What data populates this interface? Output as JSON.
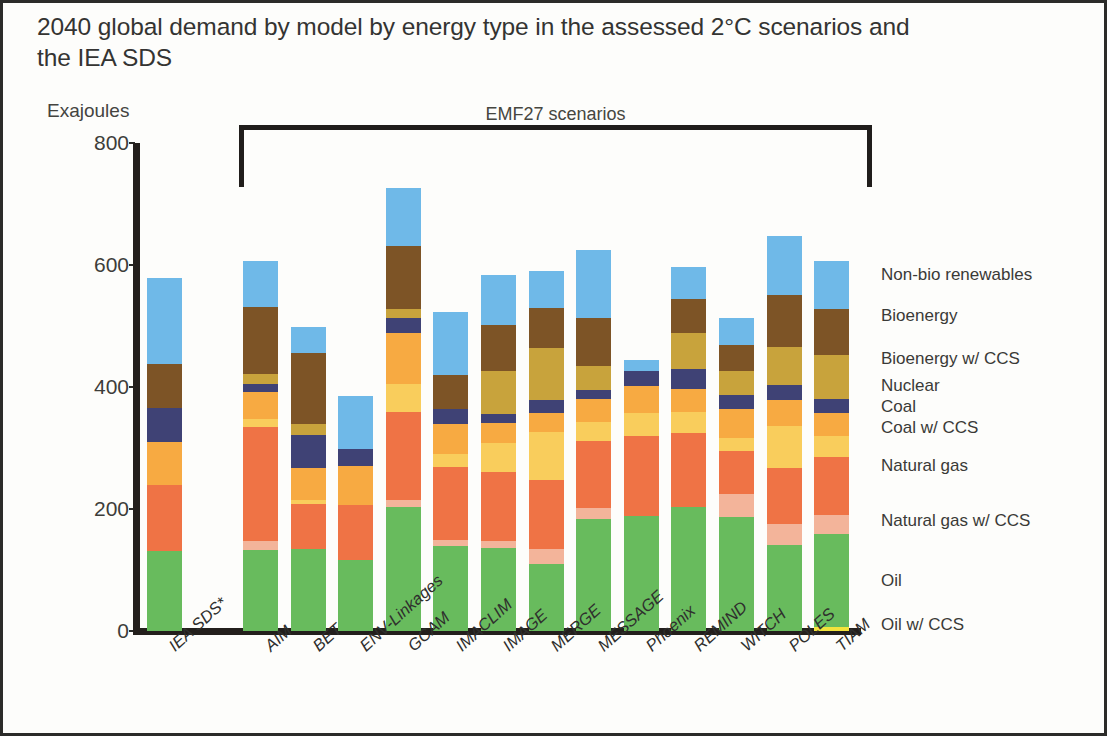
{
  "title": "2040 global demand by model by energy type in the assessed 2°C scenarios and the IEA SDS",
  "axis_unit": "Exajoules",
  "bracket_label": "EMF27 scenarios",
  "chart_data": {
    "type": "bar",
    "subtype": "stacked-column",
    "title": "2040 global demand by model by energy type in the assessed 2°C scenarios and the IEA SDS",
    "xlabel": "",
    "ylabel": "Exajoules",
    "ylim": [
      0,
      800
    ],
    "yticks": [
      0,
      200,
      400,
      600,
      800
    ],
    "ytick_labels": [
      "0",
      "200",
      "400",
      "600",
      "800"
    ],
    "grid": false,
    "legend_position": "right",
    "annotations": [
      {
        "text": "EMF27 scenarios",
        "covers": [
          "AIM",
          "BET",
          "ENV-Linkages",
          "GCAM",
          "IMACLIM",
          "IMAGE",
          "MERGE",
          "MESSAGE",
          "Phoenix",
          "REMIND",
          "WITCH",
          "POLES",
          "TIAM"
        ]
      }
    ],
    "categories": [
      "IEA SDS*",
      "AIM",
      "BET",
      "ENV-Linkages",
      "GCAM",
      "IMACLIM",
      "IMAGE",
      "MERGE",
      "MESSAGE",
      "Phoenix",
      "REMIND",
      "WITCH",
      "POLES",
      "TIAM"
    ],
    "stack_order_bottom_to_top": [
      "Oil w/ CCS",
      "Oil",
      "Natural gas w/ CCS",
      "Natural gas",
      "Coal w/ CCS",
      "Coal",
      "Nuclear",
      "Bioenergy w/ CCS",
      "Bioenergy",
      "Non-bio renewables"
    ],
    "series": [
      {
        "name": "Oil w/ CCS",
        "color": "#f2e33c",
        "values": [
          0,
          0,
          0,
          0,
          0,
          0,
          0,
          0,
          0,
          0,
          0,
          0,
          0,
          6
        ]
      },
      {
        "name": "Oil",
        "color": "#68bb5d",
        "values": [
          131,
          133,
          134,
          116,
          204,
          139,
          136,
          110,
          183,
          188,
          204,
          187,
          141,
          153
        ]
      },
      {
        "name": "Natural gas w/ CCS",
        "color": "#f3b49a",
        "values": [
          0,
          14,
          0,
          0,
          11,
          10,
          11,
          24,
          18,
          0,
          0,
          38,
          35,
          32
        ]
      },
      {
        "name": "Natural gas",
        "color": "#ef7345",
        "values": [
          108,
          187,
          75,
          91,
          144,
          120,
          113,
          113,
          110,
          131,
          120,
          70,
          92,
          95
        ]
      },
      {
        "name": "Coal w/ CCS",
        "color": "#f9cd5c",
        "values": [
          0,
          14,
          6,
          0,
          46,
          21,
          49,
          79,
          31,
          38,
          35,
          21,
          68,
          34
        ]
      },
      {
        "name": "Coal",
        "color": "#f7aa42",
        "values": [
          71,
          44,
          52,
          63,
          84,
          49,
          32,
          31,
          38,
          44,
          38,
          48,
          43,
          38
        ]
      },
      {
        "name": "Nuclear",
        "color": "#3f4275",
        "values": [
          55,
          13,
          54,
          29,
          24,
          25,
          15,
          22,
          15,
          25,
          32,
          23,
          25,
          22
        ]
      },
      {
        "name": "Bioenergy w/ CCS",
        "color": "#c8a33c",
        "values": [
          0,
          16,
          18,
          0,
          15,
          0,
          70,
          85,
          40,
          0,
          60,
          40,
          62,
          73
        ]
      },
      {
        "name": "Bioenergy",
        "color": "#7d5426",
        "values": [
          73,
          110,
          116,
          0,
          103,
          55,
          76,
          65,
          78,
          0,
          56,
          42,
          85,
          75
        ]
      },
      {
        "name": "Non-bio renewables",
        "color": "#6fb9e8",
        "values": [
          141,
          76,
          44,
          86,
          95,
          104,
          82,
          62,
          111,
          18,
          51,
          44,
          97,
          78
        ]
      }
    ],
    "totals": [
      579,
      607,
      499,
      385,
      726,
      523,
      584,
      591,
      624,
      444,
      596,
      513,
      648,
      606
    ]
  },
  "legend": {
    "items": [
      {
        "label": "Non-bio renewables",
        "color": "#6fb9e8"
      },
      {
        "label": "Bioenergy",
        "color": "#7d5426"
      },
      {
        "label": "Bioenergy w/ CCS",
        "color": "#c8a33c"
      },
      {
        "label": "Nuclear",
        "color": "#3f4275"
      },
      {
        "label": "Coal",
        "color": "#f7aa42"
      },
      {
        "label": "Coal w/ CCS",
        "color": "#f9cd5c"
      },
      {
        "label": "Natural gas",
        "color": "#ef7345"
      },
      {
        "label": "Natural gas w/ CCS",
        "color": "#f3b49a"
      },
      {
        "label": "Oil",
        "color": "#68bb5d"
      },
      {
        "label": "Oil w/ CCS",
        "color": "#f2e33c"
      }
    ]
  }
}
